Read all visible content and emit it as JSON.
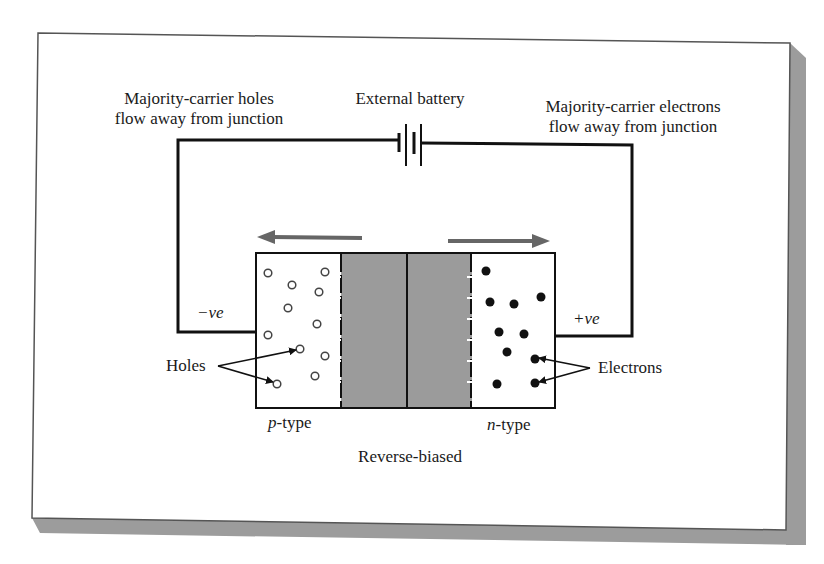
{
  "figure": {
    "caption": "Reverse-biased",
    "colors": {
      "background": "#ffffff",
      "frame_border": "#555555",
      "frame_shadow": "#9c9c9c",
      "wire": "#111111",
      "depletion_region": "#9b9b9b",
      "flow_arrow": "#666666",
      "hole_stroke": "#444444",
      "electron_fill": "#111111"
    }
  },
  "labels": {
    "left_title_line1": "Majority-carrier holes",
    "left_title_line2": "flow away from junction",
    "battery": "External battery",
    "right_title_line1": "Majority-carrier electrons",
    "right_title_line2": "flow away from junction",
    "negative_terminal": "−ve",
    "positive_terminal": "+ve",
    "holes": "Holes",
    "electrons": "Electrons",
    "p_type_letter": "p",
    "p_type_suffix": "-type",
    "n_type_letter": "n",
    "n_type_suffix": "-type",
    "caption": "Reverse-biased"
  },
  "carriers": {
    "holes": [
      [
        268,
        273
      ],
      [
        325,
        272
      ],
      [
        292,
        285
      ],
      [
        319,
        292
      ],
      [
        288,
        308
      ],
      [
        317,
        324
      ],
      [
        268,
        335
      ],
      [
        300,
        349
      ],
      [
        325,
        356
      ],
      [
        315,
        376
      ],
      [
        277,
        384
      ]
    ],
    "electrons": [
      [
        486,
        271
      ],
      [
        490,
        302
      ],
      [
        514,
        304
      ],
      [
        541,
        297
      ],
      [
        499,
        332
      ],
      [
        524,
        334
      ],
      [
        507,
        352
      ],
      [
        535,
        359
      ],
      [
        497,
        384
      ],
      [
        535,
        383
      ]
    ]
  },
  "icons": {
    "battery": "battery-symbol-icon",
    "left_arrow": "arrow-left-icon",
    "right_arrow": "arrow-right-icon"
  }
}
